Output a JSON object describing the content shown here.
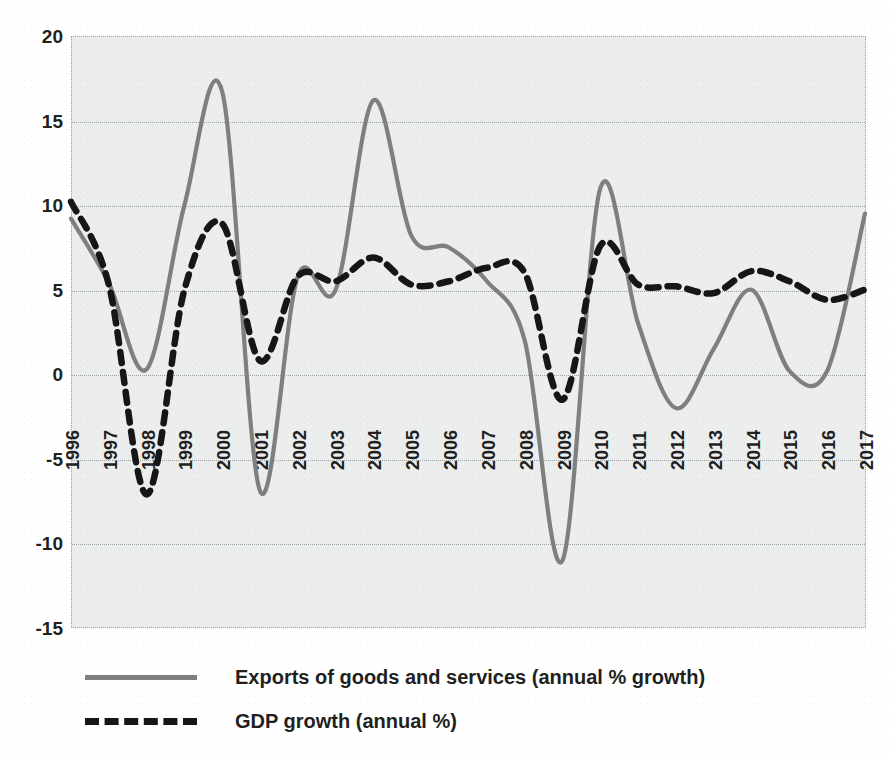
{
  "chart_data": {
    "type": "line",
    "title": "",
    "subtitle": "",
    "xlabel": "",
    "ylabel": "",
    "grid": true,
    "legend_position": "bottom-left",
    "xlim": [
      1996,
      2017
    ],
    "ylim": [
      -15,
      20
    ],
    "y_ticks": [
      20,
      15,
      10,
      5,
      0,
      -5,
      -10,
      -15
    ],
    "x_tick_labels": [
      "1996",
      "1997",
      "1998",
      "1999",
      "2000",
      "2001",
      "2002",
      "2003",
      "2004",
      "2005",
      "2006",
      "2007",
      "2008",
      "2009",
      "2010",
      "2011",
      "2012",
      "2013",
      "2014",
      "2015",
      "2016",
      "2017"
    ],
    "categories": [
      1996,
      1997,
      1998,
      1999,
      2000,
      2001,
      2002,
      2003,
      2004,
      2005,
      2006,
      2007,
      2008,
      2009,
      2010,
      2011,
      2012,
      2013,
      2014,
      2015,
      2016,
      2017
    ],
    "series": [
      {
        "name": "Exports of goods and services (annual % growth)",
        "style": "solid",
        "color": "#7f7f7f",
        "values": [
          9.2,
          5.4,
          0.3,
          10.0,
          16.7,
          -6.9,
          5.8,
          5.0,
          16.2,
          8.2,
          7.5,
          5.5,
          2.0,
          -11.0,
          11.0,
          3.0,
          -2.0,
          1.5,
          5.0,
          0.2,
          0.2,
          9.5
        ]
      },
      {
        "name": "GDP growth (annual %)",
        "style": "dashed",
        "color": "#161616",
        "values": [
          10.2,
          5.3,
          -7.1,
          5.0,
          8.9,
          0.8,
          5.8,
          5.5,
          6.9,
          5.3,
          5.5,
          6.3,
          6.0,
          -1.5,
          7.6,
          5.3,
          5.2,
          4.8,
          6.1,
          5.5,
          4.4,
          5.0
        ]
      }
    ]
  },
  "legend": {
    "items": [
      {
        "label": "Exports of goods and services (annual % growth)",
        "style": "solid"
      },
      {
        "label": "GDP growth (annual %)",
        "style": "dashed"
      }
    ]
  },
  "colors": {
    "exports_line": "#7f7f7f",
    "gdp_line": "#161616",
    "plot_background": "#eceded",
    "gridline": "#9aa0a4",
    "text": "#221f1f"
  }
}
